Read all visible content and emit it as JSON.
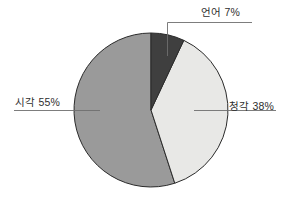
{
  "chart_data": {
    "type": "pie",
    "title": "",
    "categories": [
      "언어",
      "청각",
      "시각"
    ],
    "values": [
      7,
      38,
      55
    ],
    "unit": "%",
    "labels": [
      {
        "name": "언어",
        "value": 7,
        "text": "언어 7%",
        "color": "#3f3f3f",
        "position": "top"
      },
      {
        "name": "청각",
        "value": 38,
        "text": "청각 38%",
        "color": "#e8e8e6",
        "position": "right"
      },
      {
        "name": "시각",
        "value": 55,
        "text": "시각 55%",
        "color": "#9a9a9a",
        "position": "left"
      }
    ],
    "start_angle": 0,
    "direction": "clockwise",
    "legend": "none",
    "grid": false,
    "outline_color": "#2b2b2b",
    "leader_line_color": "#6e6e6e",
    "background": "#ffffff"
  },
  "chart": {
    "slices": {
      "language": {
        "label": "언어 7%",
        "percent": 7,
        "color": "#3f3f3f"
      },
      "auditory": {
        "label": "청각 38%",
        "percent": 38,
        "color": "#e8e8e6"
      },
      "visual": {
        "label": "시각 55%",
        "percent": 55,
        "color": "#9a9a9a"
      }
    }
  }
}
